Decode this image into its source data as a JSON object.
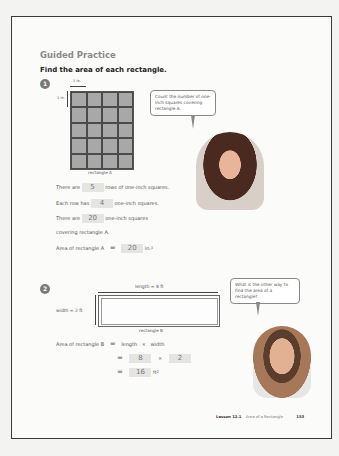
{
  "header": {
    "section_title": "Guided Practice",
    "instruction": "Find the area of each rectangle."
  },
  "problem1": {
    "number": "1",
    "dim_label_h": "1 in.",
    "dim_label_v": "1 in.",
    "grid": {
      "columns": 4,
      "rows": 5
    },
    "rect_label": "rectangle A",
    "bubble": "Count the number of one-inch squares covering rectangle A.",
    "lines": [
      {
        "prefix": "There are",
        "answer": "5",
        "suffix": "rows of one-inch squares."
      },
      {
        "prefix": "Each row has",
        "answer": "4",
        "suffix": "one-inch squares."
      },
      {
        "prefix": "There are",
        "answer": "20",
        "suffix": "one-inch squares"
      },
      {
        "prefix": "covering rectangle A.",
        "answer": "",
        "suffix": ""
      }
    ],
    "area_prefix": "Area of rectangle A",
    "equals": "=",
    "area_answer": "20",
    "area_unit": "in.²"
  },
  "problem2": {
    "number": "2",
    "length_label": "length = 8 ft",
    "width_label": "width = 2 ft",
    "rect_label": "rectangle B",
    "bubble": "What is the other way to find the area of a rectangle?",
    "formula_prefix": "Area of rectangle B",
    "equals": "=",
    "formula_length": "length",
    "times": "×",
    "formula_width": "width",
    "answer_length": "8",
    "answer_width": "2",
    "answer_area": "16",
    "area_unit": "ft²"
  },
  "footer": {
    "lesson": "Lesson 12.1",
    "lesson_title": "Area of a Rectangle",
    "page_number": "153"
  }
}
